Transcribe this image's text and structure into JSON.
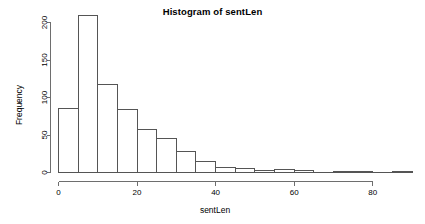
{
  "chart_data": {
    "type": "bar",
    "title": "Histogram of sentLen",
    "xlabel": "sentLen",
    "ylabel": "Frequency",
    "xlim": [
      0,
      90
    ],
    "ylim": [
      0,
      215
    ],
    "grid": false,
    "legend": null,
    "bin_width": 5,
    "x_ticks": [
      0,
      20,
      40,
      60,
      80
    ],
    "x_tick_labels": [
      "0",
      "20",
      "40",
      "60",
      "80"
    ],
    "y_ticks": [
      0,
      50,
      100,
      150,
      200
    ],
    "y_tick_labels": [
      "0",
      "50",
      "100",
      "150",
      "200"
    ],
    "bin_edges": [
      0,
      5,
      10,
      15,
      20,
      25,
      30,
      35,
      40,
      45,
      50,
      55,
      60,
      65,
      70,
      75,
      80,
      85,
      90
    ],
    "categories": [
      "0-5",
      "5-10",
      "10-15",
      "15-20",
      "20-25",
      "25-30",
      "30-35",
      "35-40",
      "40-45",
      "45-50",
      "50-55",
      "55-60",
      "60-65",
      "65-70",
      "70-75",
      "75-80",
      "80-85",
      "85-90"
    ],
    "values": [
      86,
      210,
      117,
      84,
      58,
      46,
      28,
      15,
      7,
      6,
      3,
      4,
      3,
      0,
      1,
      1,
      0,
      1
    ]
  },
  "style": {
    "background": "#ffffff",
    "bar_fill": "#ffffff",
    "bar_stroke": "#555555",
    "axis_color": "#6e6e6e",
    "text_color": "#000000"
  }
}
